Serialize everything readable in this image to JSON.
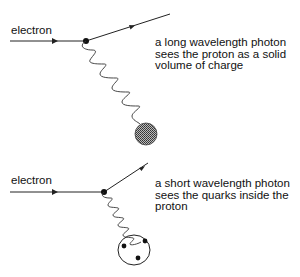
{
  "panels": [
    {
      "particle_label": "electron",
      "caption_lines": [
        "a long wavelength photon",
        "sees the proton as a solid",
        "volume of charge"
      ],
      "target": "solid-proton"
    },
    {
      "particle_label": "electron",
      "caption_lines": [
        "a short wavelength photon",
        "sees the quarks inside the",
        "proton"
      ],
      "target": "proton-with-quarks"
    }
  ],
  "colors": {
    "line": "#222222",
    "proton_fill": "#777777",
    "background": "#ffffff"
  }
}
